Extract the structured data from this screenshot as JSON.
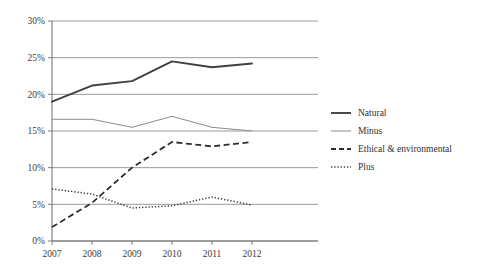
{
  "chart_data": {
    "type": "line",
    "title": "",
    "subtitle": "",
    "xlabel": "",
    "ylabel": "",
    "categories": [
      "2007",
      "2008",
      "2009",
      "2010",
      "2011",
      "2012"
    ],
    "x_tick_labels": [
      "2007",
      "2008",
      "2009",
      "2010",
      "2011",
      "2012"
    ],
    "y_tick_labels": [
      "0%",
      "5%",
      "10%",
      "15%",
      "20%",
      "25%",
      "30%"
    ],
    "y_tick_values": [
      0,
      5,
      10,
      15,
      20,
      25,
      30
    ],
    "ylim": [
      0,
      30
    ],
    "y_unit": "%",
    "grid": "horizontal",
    "legend_position": "right",
    "series": [
      {
        "name": "Natural",
        "line_style": "solid",
        "line_width": "thick",
        "color": "#404040",
        "values": [
          19.0,
          21.2,
          21.8,
          24.5,
          23.7,
          24.2
        ]
      },
      {
        "name": "Minus",
        "line_style": "solid",
        "line_width": "thin",
        "color": "#8a8a8a",
        "values": [
          16.6,
          16.6,
          15.5,
          17.0,
          15.5,
          15.0
        ]
      },
      {
        "name": "Ethical & environmental",
        "line_style": "dashed",
        "line_width": "medium",
        "color": "#2e2e2e",
        "values": [
          1.9,
          5.2,
          10.0,
          13.5,
          12.9,
          13.5
        ]
      },
      {
        "name": "Plus",
        "line_style": "dotted",
        "line_width": "medium",
        "color": "#3a3a3a",
        "values": [
          7.1,
          6.4,
          4.5,
          4.8,
          6.0,
          4.9
        ]
      }
    ]
  },
  "legend": {
    "items": [
      {
        "label": "Natural",
        "style": "solid-thick"
      },
      {
        "label": "Minus",
        "style": "solid-thin"
      },
      {
        "label": "Ethical & environmental",
        "style": "dashed"
      },
      {
        "label": "Plus",
        "style": "dotted"
      }
    ]
  },
  "colors": {
    "background": "#ffffff",
    "grid": "#808080",
    "axis": "#6e6e6e",
    "text": "#3b3b3b"
  }
}
